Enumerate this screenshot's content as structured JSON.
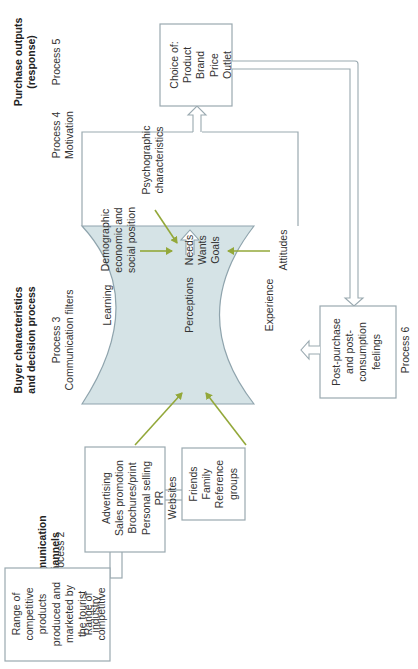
{
  "headers": {
    "stimulus": {
      "title": "Stimulus input",
      "process": "Process 1"
    },
    "channels": {
      "title_lines": [
        "Communication",
        "channels"
      ],
      "process": "Process 2"
    },
    "buyer": {
      "title_lines": [
        "Buyer characteristics",
        "and decision process"
      ],
      "process_lines": [
        "Process 3",
        "Communication filters"
      ]
    },
    "motivation": {
      "process_lines": [
        "Process 4",
        "Motivation"
      ]
    },
    "outputs": {
      "title_lines": [
        "Purchase outputs",
        "(response)"
      ],
      "process": "Process 5"
    },
    "post": {
      "process": "Process 6"
    }
  },
  "boxes": {
    "stimulus": [
      "Range of",
      "competitive",
      "products",
      "produced and",
      "marketed by",
      "the tourist",
      "industry"
    ],
    "channels": [
      "Advertising",
      "Sales promotion",
      "Brochures/print",
      "Personal selling",
      "PR",
      "Websites"
    ],
    "friends": [
      "Friends",
      "Family",
      "Reference",
      "groups"
    ],
    "choice": [
      "Choice of:",
      "Product",
      "Brand",
      "Price",
      "Outlet"
    ],
    "post_purchase": [
      "Post-purchase",
      "and post-",
      "consumption",
      "feelings"
    ]
  },
  "filters": {
    "learning": "Learning",
    "perceptions": "Perceptions",
    "experience": "Experience"
  },
  "motivation": {
    "demographic": [
      "Demographic",
      "economic and",
      "social position"
    ],
    "psychographic": [
      "Psychographic",
      "characteristics"
    ],
    "center": [
      "Needs",
      "Wants",
      "Goals"
    ],
    "attitudes": "Attitudes"
  },
  "colors": {
    "filter_fill": "#d5e3e6",
    "filter_stroke": "#8fa4ad",
    "box_stroke": "#9aa9b0",
    "influence_arrow": "#93a83a"
  }
}
